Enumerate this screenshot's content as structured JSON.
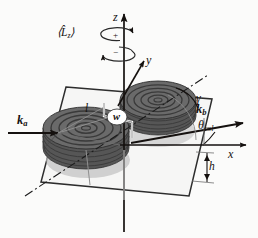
{
  "figure": {
    "background_color": "#fbfbfa",
    "ink_color": "#15110f",
    "disc_fill_color": "#5a5a5a",
    "disc_shadow_color": "#b9b9b9",
    "plane_color": "#2b2b2b"
  },
  "axes": [
    {
      "id": "z",
      "label": "z",
      "description": "vertical rotation axis pointing up"
    },
    {
      "id": "y",
      "label": "y",
      "description": "in-plane axis pointing up-right"
    },
    {
      "id": "x",
      "label": "x",
      "description": "in-plane axis pointing right"
    }
  ],
  "operators": [
    {
      "id": "Lz",
      "label": "⟨L̂",
      "subscript": "z",
      "closing": "⟩",
      "description": "expectation value of angular momentum about z"
    }
  ],
  "rotation_arrows": [
    {
      "id": "positive",
      "sign": "+",
      "description": "counter-rotating loop about z, positive sense"
    },
    {
      "id": "negative",
      "sign": "−",
      "description": "counter-rotating loop about z, negative sense"
    }
  ],
  "vectors": [
    {
      "id": "ka",
      "symbol": "k",
      "subscript": "a",
      "description": "incoming wavevector, points right"
    },
    {
      "id": "kb",
      "symbol": "k",
      "subscript": "b",
      "description": "outgoing wavevector, points up-right"
    }
  ],
  "angles": [
    {
      "id": "gamma",
      "label": "γ",
      "description": "angle between disc long axis and dash-dot reference line"
    },
    {
      "id": "theta_col",
      "label": "θ",
      "subscript": "col",
      "description": "collision angle between k_b and x axis"
    }
  ],
  "dimensions": [
    {
      "id": "length",
      "label": "l",
      "description": "disc separation / rotor length"
    },
    {
      "id": "width",
      "label": "w",
      "description": "disc width, shown in white oval at center"
    },
    {
      "id": "height",
      "label": "h",
      "description": "disc height, double-headed arrow at right"
    }
  ],
  "discs": [
    {
      "id": "front-disc",
      "position": "front-left",
      "layers": 7,
      "description": "stacked concentric ellipse disc"
    },
    {
      "id": "back-disc",
      "position": "back-right",
      "layers": 7,
      "description": "stacked concentric ellipse disc"
    }
  ]
}
